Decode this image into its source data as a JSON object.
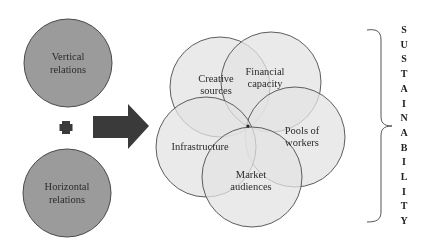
{
  "diagram": {
    "inputs": [
      {
        "label_line1": "Vertical",
        "label_line2": "relations",
        "cx": 68,
        "cy": 63,
        "r": 44
      },
      {
        "label_line1": "Horizontal",
        "label_line2": "relations",
        "cx": 67,
        "cy": 193,
        "r": 44
      }
    ],
    "operator": "plus",
    "flower": [
      {
        "id": "creative",
        "label_line1": "Creative",
        "label_line2": "sources",
        "cx": 220,
        "cy": 87,
        "r": 50,
        "tx": 216,
        "ty": 82
      },
      {
        "id": "financial",
        "label_line1": "Financial",
        "label_line2": "capacity",
        "cx": 271,
        "cy": 82,
        "r": 50,
        "tx": 265,
        "ty": 75
      },
      {
        "id": "pools",
        "label_line1": "Pools of",
        "label_line2": "workers",
        "cx": 295,
        "cy": 137,
        "r": 50,
        "tx": 302,
        "ty": 133
      },
      {
        "id": "infrastructure",
        "label_line1": "Infrastructure",
        "label_line2": "",
        "cx": 206,
        "cy": 147,
        "r": 50,
        "tx": 201,
        "ty": 150
      },
      {
        "id": "market",
        "label_line1": "Market",
        "label_line2": "audiences",
        "cx": 252,
        "cy": 177,
        "r": 50,
        "tx": 251,
        "ty": 176
      }
    ],
    "outcome_letters": [
      "S",
      "U",
      "S",
      "T",
      "A",
      "I",
      "N",
      "A",
      "B",
      "I",
      "L",
      "I",
      "T",
      "Y"
    ],
    "colors": {
      "input_fill": "#9b9b9b",
      "input_stroke": "#4a4a4a",
      "flower_fill": "#dcdcdc",
      "flower_stroke": "#4d4d4d",
      "arrow": "#3a3a3a",
      "bracket": "#555555"
    }
  }
}
